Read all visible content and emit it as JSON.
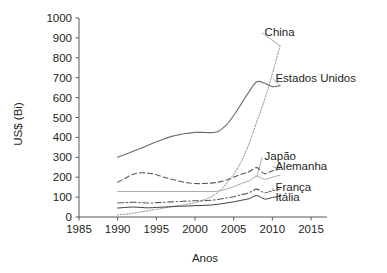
{
  "chart_data": {
    "type": "line",
    "title": "",
    "xlabel": "Anos",
    "ylabel": "US$ (Bi)",
    "xlim": [
      1985,
      2015
    ],
    "ylim": [
      0,
      1000
    ],
    "xticks": [
      1985,
      1990,
      1995,
      2000,
      2005,
      2010,
      2015
    ],
    "yticks": [
      0,
      100,
      200,
      300,
      400,
      500,
      600,
      700,
      800,
      900,
      1000
    ],
    "grid": false,
    "legend_position": "inline-right-labels",
    "x": [
      1990,
      1991,
      1992,
      1993,
      1994,
      1995,
      1996,
      1997,
      1998,
      1999,
      2000,
      2001,
      2002,
      2003,
      2004,
      2005,
      2006,
      2007,
      2008,
      2009,
      2010,
      2011
    ],
    "series": [
      {
        "name": "China",
        "label": "China",
        "style": "fine-dotted",
        "color": "#8c8c8c",
        "label_x": 2009.0,
        "label_y": 930,
        "values": [
          10,
          14,
          19,
          25,
          32,
          38,
          45,
          52,
          58,
          64,
          72,
          84,
          100,
          125,
          165,
          215,
          280,
          370,
          480,
          590,
          720,
          860
        ]
      },
      {
        "name": "Estados Unidos",
        "label": "Estados Unidos",
        "style": "solid",
        "color": "#6d6e71",
        "label_x": 2010.4,
        "label_y": 700,
        "values": [
          300,
          315,
          330,
          345,
          362,
          378,
          392,
          405,
          414,
          420,
          425,
          425,
          424,
          430,
          460,
          510,
          570,
          630,
          680,
          672,
          655,
          660
        ]
      },
      {
        "name": "Japão",
        "label": "Japão",
        "style": "solid-light",
        "color": "#a7a9ac",
        "label_x": 2009.0,
        "label_y": 305,
        "values": [
          128,
          128,
          128,
          128,
          128,
          128,
          128,
          128,
          128,
          128,
          128,
          128,
          128,
          130,
          140,
          152,
          168,
          182,
          205,
          190,
          200,
          210
        ]
      },
      {
        "name": "Alemanha",
        "label": "Alemanha",
        "style": "dashed",
        "color": "#58595b",
        "label_x": 2010.4,
        "label_y": 258,
        "values": [
          175,
          195,
          215,
          222,
          220,
          212,
          200,
          190,
          180,
          172,
          168,
          168,
          170,
          175,
          185,
          200,
          215,
          228,
          248,
          218,
          232,
          240
        ]
      },
      {
        "name": "França",
        "label": "França",
        "style": "dash-dot",
        "color": "#58595b",
        "label_x": 2010.4,
        "label_y": 150,
        "values": [
          70,
          72,
          74,
          72,
          70,
          72,
          74,
          76,
          78,
          80,
          82,
          82,
          84,
          88,
          95,
          102,
          112,
          122,
          140,
          122,
          132,
          140
        ]
      },
      {
        "name": "Itália",
        "label": "Itália",
        "style": "solid-thin",
        "color": "#414042",
        "label_x": 2010.4,
        "label_y": 98,
        "values": [
          45,
          48,
          50,
          48,
          46,
          48,
          50,
          52,
          54,
          55,
          57,
          58,
          60,
          64,
          70,
          76,
          84,
          92,
          108,
          90,
          98,
          104
        ]
      }
    ]
  }
}
